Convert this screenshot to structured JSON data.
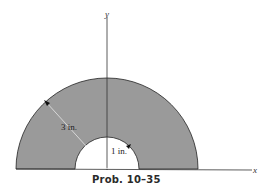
{
  "figure": {
    "caption": "Prob. 10–35",
    "axes": {
      "x_label": "x",
      "y_label": "y"
    },
    "dimensions": {
      "outer_radius_label": "3 in.",
      "inner_radius_label": "1 in."
    },
    "colors": {
      "fill": "#9a9a9a",
      "stroke": "#222222",
      "background": "#ffffff"
    }
  }
}
